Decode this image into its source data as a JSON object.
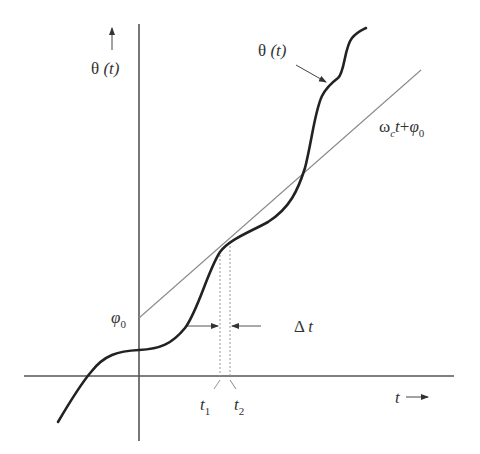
{
  "diagram": {
    "type": "phase-vs-time plot",
    "axes": {
      "y_label_symbol": "θ",
      "y_label_arg": "(t)",
      "x_label": "t",
      "arrow": "→"
    },
    "curve": {
      "label_symbol": "θ",
      "label_arg": "(t)",
      "color": "#222222"
    },
    "line": {
      "label_omega": "ω",
      "label_omega_sub": "c",
      "label_t": "t",
      "label_plus": "+",
      "label_phi": "φ",
      "label_phi_sub": "0",
      "color": "#8a8a8a"
    },
    "intercept": {
      "symbol": "φ",
      "sub": "0"
    },
    "interval": {
      "delta_symbol": "Δ",
      "delta_var": "t",
      "t1": "t",
      "t1_sub": "1",
      "t2": "t",
      "t2_sub": "2"
    }
  }
}
